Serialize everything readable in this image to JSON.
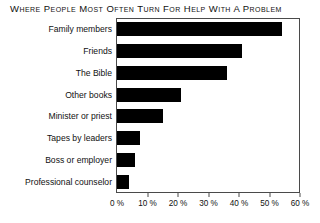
{
  "chart_data": {
    "type": "bar",
    "orientation": "horizontal",
    "title": "Where People Most Often Turn for Help With a Problem",
    "xlabel": "",
    "ylabel": "",
    "categories": [
      "Family members",
      "Friends",
      "The Bible",
      "Other books",
      "Minister or priest",
      "Tapes by leaders",
      "Boss or employer",
      "Professional counselor"
    ],
    "values": [
      54,
      41,
      36,
      21,
      15,
      7.5,
      6,
      4
    ],
    "xlim": [
      0,
      60
    ],
    "xticks": [
      0,
      10,
      20,
      30,
      40,
      50,
      60
    ],
    "xtick_labels": [
      "0 %",
      "10 %",
      "20 %",
      "30 %",
      "40 %",
      "50 %",
      "60 %"
    ],
    "grid": false,
    "legend": false,
    "bar_color": "#000000",
    "frame_color": "#4a4a4a",
    "background": "#ffffff"
  }
}
